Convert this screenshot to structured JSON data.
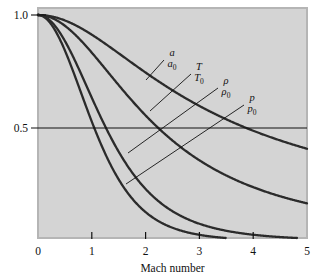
{
  "figure": {
    "name": "isentropic-flow-ratios-chart",
    "background_color": "#ffffff",
    "plot_background_color": "#d4d4d4",
    "plot_border_color": "#b5b5b5",
    "curve_color": "#2b2b2b",
    "axis_color": "#111111"
  },
  "axes": {
    "x": {
      "label": "Mach number",
      "min": 0,
      "max": 5,
      "ticks": [
        0,
        1,
        2,
        3,
        4,
        5
      ],
      "tick_labels": [
        "0",
        "1",
        "2",
        "3",
        "4",
        "5"
      ]
    },
    "y": {
      "label": "",
      "min": 0,
      "max": 1.0,
      "ticks": [
        0.5,
        1.0
      ],
      "tick_labels": [
        "0.5",
        "1.0"
      ]
    }
  },
  "reference_line": {
    "name": "half-value-reference-line",
    "y": 0.5,
    "label": "0.5"
  },
  "curve_labels": [
    {
      "id": "a-a0",
      "numerator": "a",
      "denominator": "a",
      "den_sub": "0",
      "x": 168,
      "y": 56,
      "leader_to_x": 146,
      "leader_to_y": 80
    },
    {
      "id": "T-T0",
      "numerator": "T",
      "denominator": "T",
      "den_sub": "0",
      "x": 195,
      "y": 70,
      "leader_to_x": 150,
      "leader_to_y": 111
    },
    {
      "id": "rho-rho0",
      "numerator": "ρ",
      "denominator": "ρ",
      "den_sub": "0",
      "x": 222,
      "y": 84,
      "leader_to_x": 128,
      "leader_to_y": 153
    },
    {
      "id": "p-p0",
      "numerator": "p",
      "denominator": "p",
      "den_sub": "0",
      "x": 248,
      "y": 101,
      "leader_to_x": 126,
      "leader_to_y": 184
    }
  ],
  "chart_data": {
    "type": "line",
    "title": "",
    "subtitle": "",
    "xlabel": "Mach number",
    "ylabel": "",
    "xlim": [
      0,
      5
    ],
    "ylim": [
      0,
      1.0
    ],
    "grid": false,
    "legend": "inline-curve-labels",
    "gamma": 1.4,
    "annotations": [
      {
        "text": "0.5",
        "type": "y-reference-line",
        "value": 0.5
      }
    ],
    "x": [
      0,
      0.25,
      0.5,
      0.75,
      1,
      1.25,
      1.5,
      1.75,
      2,
      2.25,
      2.5,
      2.75,
      3,
      3.25,
      3.5,
      3.75,
      4,
      4.25,
      4.5,
      4.75,
      5
    ],
    "series": [
      {
        "name": "a/a0",
        "label_numerator": "a",
        "label_denominator": "a0",
        "values": [
          1.0,
          0.994,
          0.976,
          0.947,
          0.913,
          0.874,
          0.835,
          0.796,
          0.756,
          0.72,
          0.686,
          0.654,
          0.625,
          0.597,
          0.572,
          0.549,
          0.527,
          0.507,
          0.489,
          0.472,
          0.456
        ]
      },
      {
        "name": "T/T0",
        "label_numerator": "T",
        "label_denominator": "T0",
        "values": [
          1.0,
          0.988,
          0.952,
          0.899,
          0.833,
          0.762,
          0.69,
          0.621,
          0.556,
          0.497,
          0.444,
          0.397,
          0.357,
          0.321,
          0.29,
          0.263,
          0.238,
          0.217,
          0.198,
          0.181,
          0.167
        ]
      },
      {
        "name": "rho/rho0",
        "label_numerator": "ρ",
        "label_denominator": "ρ0",
        "values": [
          1.0,
          0.969,
          0.885,
          0.761,
          0.634,
          0.516,
          0.414,
          0.33,
          0.23,
          0.176,
          0.132,
          0.1,
          0.076,
          0.058,
          0.045,
          0.035,
          0.028,
          0.022,
          0.018,
          0.014,
          0.012
        ]
      },
      {
        "name": "p/p0",
        "label_numerator": "p",
        "label_denominator": "p0",
        "values": [
          1.0,
          0.957,
          0.843,
          0.689,
          0.528,
          0.383,
          0.272,
          0.187,
          0.128,
          0.086,
          0.058,
          0.039,
          0.027,
          0.019,
          0.013,
          0.009,
          0.007,
          0.005,
          0.003,
          0.002,
          0.002
        ]
      }
    ],
    "crossings_at_half": {
      "p/p0": 1.02,
      "rho/rho0": 1.42,
      "T/T0": 2.24,
      "a/a0": 4.47
    }
  }
}
